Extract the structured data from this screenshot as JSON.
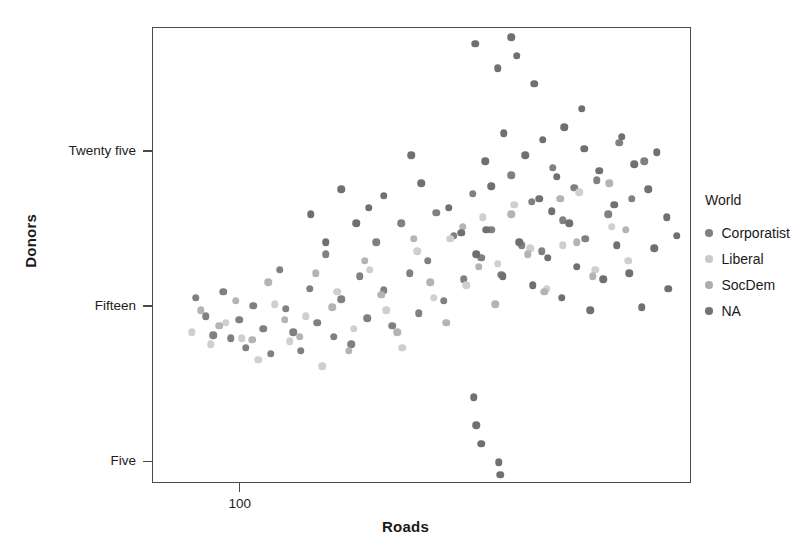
{
  "chart_data": {
    "type": "scatter",
    "title": "",
    "xlabel": "Roads",
    "ylabel": "Donors",
    "xticks": [
      {
        "label": "100",
        "value": 100
      }
    ],
    "yticks": [
      {
        "label": "Five",
        "value": 5
      },
      {
        "label": "Fifteen",
        "value": 15
      },
      {
        "label": "Twenty five",
        "value": 25
      }
    ],
    "xlim": [
      30,
      460
    ],
    "ylim": [
      3.6,
      33.0
    ],
    "grid": false,
    "legend": {
      "title": "World",
      "position": "right",
      "entries": [
        {
          "label": "Corporatist",
          "color": "#808080"
        },
        {
          "label": "Liberal",
          "color": "#c9c9c9"
        },
        {
          "label": "SocDem",
          "color": "#adadad"
        },
        {
          "label": "NA",
          "color": "#737373"
        }
      ]
    },
    "series": [
      {
        "name": "Corporatist",
        "color": "#808080",
        "points": [
          [
            64,
            15.6
          ],
          [
            72,
            14.4
          ],
          [
            78,
            13.2
          ],
          [
            86,
            16.0
          ],
          [
            92,
            13.0
          ],
          [
            99,
            14.2
          ],
          [
            104,
            12.4
          ],
          [
            110,
            15.1
          ],
          [
            118,
            13.6
          ],
          [
            124,
            12.0
          ],
          [
            131,
            17.4
          ],
          [
            136,
            14.9
          ],
          [
            142,
            13.4
          ],
          [
            148,
            12.2
          ],
          [
            155,
            16.2
          ],
          [
            161,
            14.0
          ],
          [
            168,
            18.4
          ],
          [
            174,
            13.1
          ],
          [
            180,
            15.5
          ],
          [
            188,
            12.6
          ],
          [
            195,
            17.0
          ],
          [
            201,
            14.3
          ],
          [
            208,
            19.2
          ],
          [
            214,
            16.1
          ],
          [
            221,
            13.8
          ],
          [
            228,
            20.4
          ],
          [
            235,
            17.2
          ],
          [
            242,
            14.6
          ],
          [
            249,
            18.0
          ],
          [
            256,
            21.1
          ],
          [
            262,
            15.4
          ],
          [
            270,
            19.6
          ],
          [
            278,
            16.8
          ],
          [
            285,
            22.3
          ],
          [
            292,
            18.2
          ],
          [
            300,
            20.0
          ],
          [
            308,
            17.1
          ],
          [
            316,
            23.5
          ],
          [
            324,
            19.0
          ],
          [
            332,
            21.8
          ],
          [
            340,
            18.6
          ],
          [
            349,
            24.0
          ],
          [
            357,
            20.6
          ],
          [
            366,
            22.7
          ],
          [
            375,
            19.4
          ],
          [
            384,
            23.2
          ],
          [
            393,
            21.0
          ],
          [
            402,
            25.6
          ],
          [
            412,
            22.0
          ],
          [
            422,
            24.4
          ]
        ]
      },
      {
        "name": "Liberal",
        "color": "#cfcfcf",
        "points": [
          [
            61,
            13.4
          ],
          [
            76,
            12.6
          ],
          [
            88,
            14.0
          ],
          [
            101,
            13.0
          ],
          [
            114,
            11.6
          ],
          [
            127,
            15.2
          ],
          [
            139,
            12.8
          ],
          [
            152,
            14.4
          ],
          [
            165,
            11.2
          ],
          [
            177,
            16.0
          ],
          [
            190,
            13.6
          ],
          [
            203,
            17.4
          ],
          [
            216,
            14.8
          ],
          [
            229,
            12.4
          ],
          [
            241,
            18.6
          ],
          [
            254,
            15.6
          ],
          [
            267,
            19.4
          ],
          [
            280,
            16.4
          ],
          [
            293,
            20.8
          ],
          [
            305,
            17.8
          ],
          [
            318,
            21.6
          ],
          [
            331,
            18.8
          ],
          [
            344,
            16.2
          ],
          [
            357,
            19.0
          ],
          [
            370,
            22.4
          ],
          [
            383,
            17.4
          ],
          [
            396,
            20.2
          ],
          [
            409,
            18.0
          ]
        ]
      },
      {
        "name": "SocDem",
        "color": "#b4b4b4",
        "points": [
          [
            68,
            14.8
          ],
          [
            83,
            13.8
          ],
          [
            96,
            15.4
          ],
          [
            109,
            12.9
          ],
          [
            122,
            16.6
          ],
          [
            135,
            14.2
          ],
          [
            147,
            13.1
          ],
          [
            160,
            17.2
          ],
          [
            173,
            15.0
          ],
          [
            186,
            12.2
          ],
          [
            199,
            18.0
          ],
          [
            212,
            15.8
          ],
          [
            225,
            13.4
          ],
          [
            238,
            19.4
          ],
          [
            251,
            16.6
          ],
          [
            264,
            14.0
          ],
          [
            277,
            20.2
          ],
          [
            290,
            17.6
          ],
          [
            303,
            15.2
          ],
          [
            316,
            21.0
          ],
          [
            329,
            18.4
          ],
          [
            342,
            16.0
          ],
          [
            355,
            22.0
          ],
          [
            368,
            19.2
          ],
          [
            381,
            17.0
          ],
          [
            394,
            23.0
          ],
          [
            407,
            20.0
          ]
        ]
      },
      {
        "name": "NA",
        "color": "#707070",
        "points": [
          [
            287,
            32.0
          ],
          [
            305,
            30.4
          ],
          [
            316,
            32.4
          ],
          [
            320,
            31.2
          ],
          [
            334,
            29.4
          ],
          [
            372,
            27.8
          ],
          [
            310,
            26.2
          ],
          [
            295,
            24.4
          ],
          [
            327,
            24.8
          ],
          [
            341,
            25.8
          ],
          [
            352,
            23.4
          ],
          [
            358,
            26.6
          ],
          [
            300,
            22.8
          ],
          [
            338,
            22.0
          ],
          [
            348,
            21.2
          ],
          [
            362,
            20.4
          ],
          [
            374,
            25.2
          ],
          [
            386,
            23.8
          ],
          [
            398,
            21.6
          ],
          [
            404,
            26.0
          ],
          [
            414,
            24.2
          ],
          [
            425,
            22.6
          ],
          [
            432,
            25.0
          ],
          [
            440,
            20.8
          ],
          [
            266,
            21.4
          ],
          [
            276,
            19.8
          ],
          [
            288,
            18.4
          ],
          [
            296,
            20.0
          ],
          [
            309,
            17.0
          ],
          [
            322,
            19.2
          ],
          [
            333,
            16.4
          ],
          [
            345,
            18.2
          ],
          [
            356,
            15.6
          ],
          [
            368,
            17.6
          ],
          [
            379,
            14.8
          ],
          [
            389,
            16.8
          ],
          [
            400,
            19.0
          ],
          [
            410,
            17.2
          ],
          [
            420,
            15.0
          ],
          [
            430,
            18.8
          ],
          [
            441,
            16.2
          ],
          [
            448,
            19.6
          ],
          [
            286,
            9.2
          ],
          [
            288,
            7.4
          ],
          [
            292,
            6.2
          ],
          [
            306,
            5.0
          ],
          [
            307,
            4.2
          ],
          [
            236,
            24.8
          ],
          [
            244,
            23.0
          ],
          [
            214,
            22.2
          ],
          [
            202,
            21.4
          ],
          [
            192,
            20.4
          ],
          [
            180,
            22.6
          ],
          [
            168,
            19.2
          ],
          [
            156,
            21.0
          ]
        ]
      }
    ]
  }
}
